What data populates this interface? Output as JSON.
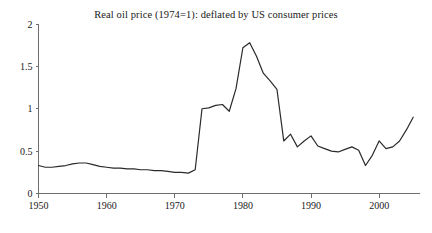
{
  "chart_data": {
    "type": "line",
    "title": "Real oil price (1974=1): deflated by US consumer prices",
    "xlabel": "",
    "ylabel": "",
    "xlim": [
      1950,
      2006
    ],
    "ylim": [
      0,
      2
    ],
    "grid": false,
    "legend": null,
    "xticks": [
      1950,
      1960,
      1970,
      1980,
      1990,
      2000
    ],
    "xtick_labels": [
      "1950",
      "1960",
      "1970",
      "1980",
      "1990",
      "2000"
    ],
    "yticks": [
      0,
      0.5,
      1,
      1.5,
      2
    ],
    "ytick_labels": [
      "0",
      "0.5",
      "1",
      "1.5",
      "2"
    ],
    "line_color": "#2a2a2a",
    "axis_color": "#6e6e6e",
    "background_color": "#ffffff",
    "x": [
      1950,
      1951,
      1952,
      1953,
      1954,
      1955,
      1956,
      1957,
      1958,
      1959,
      1960,
      1961,
      1962,
      1963,
      1964,
      1965,
      1966,
      1967,
      1968,
      1969,
      1970,
      1971,
      1972,
      1973,
      1974,
      1975,
      1976,
      1977,
      1978,
      1979,
      1980,
      1981,
      1982,
      1983,
      1984,
      1985,
      1986,
      1987,
      1988,
      1989,
      1990,
      1991,
      1992,
      1993,
      1994,
      1995,
      1996,
      1997,
      1998,
      1999,
      2000,
      2001,
      2002,
      2003,
      2004,
      2005
    ],
    "values": [
      0.33,
      0.31,
      0.31,
      0.32,
      0.33,
      0.35,
      0.36,
      0.36,
      0.34,
      0.32,
      0.31,
      0.3,
      0.3,
      0.29,
      0.29,
      0.28,
      0.28,
      0.27,
      0.27,
      0.26,
      0.25,
      0.25,
      0.24,
      0.28,
      1.0,
      1.01,
      1.04,
      1.05,
      0.97,
      1.24,
      1.72,
      1.78,
      1.62,
      1.42,
      1.33,
      1.23,
      0.62,
      0.7,
      0.55,
      0.62,
      0.68,
      0.56,
      0.53,
      0.5,
      0.49,
      0.52,
      0.55,
      0.51,
      0.33,
      0.45,
      0.62,
      0.53,
      0.55,
      0.62,
      0.75,
      0.9
    ]
  }
}
